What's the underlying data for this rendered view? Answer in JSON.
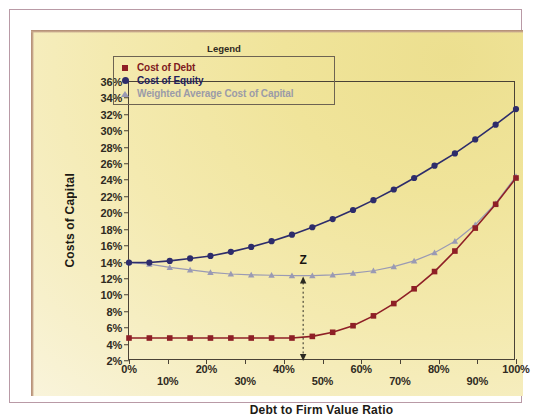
{
  "chart_data": {
    "type": "line",
    "title": "",
    "xlabel": "Debt to Firm Value Ratio",
    "ylabel": "Costs of Capital",
    "xlim": [
      0,
      100
    ],
    "ylim": [
      2,
      36
    ],
    "xticks": [
      "0%",
      "10%",
      "20%",
      "30%",
      "40%",
      "50%",
      "60%",
      "70%",
      "80%",
      "90%",
      "100%"
    ],
    "yticks": [
      "2%",
      "4%",
      "6%",
      "8%",
      "10%",
      "12%",
      "14%",
      "16%",
      "18%",
      "20%",
      "22%",
      "24%",
      "26%",
      "28%",
      "30%",
      "32%",
      "34%",
      "36%"
    ],
    "grid": false,
    "legend_position": "top-center",
    "legend_title": "Legend",
    "x": [
      0,
      5.26,
      10.53,
      15.79,
      21.05,
      26.32,
      31.58,
      36.84,
      42.11,
      47.37,
      52.63,
      57.89,
      63.16,
      68.42,
      73.68,
      78.95,
      84.21,
      89.47,
      94.74,
      100
    ],
    "series": [
      {
        "name": "Cost of Debt",
        "color": "#8e1f26",
        "marker": "square",
        "values": [
          4.8,
          4.8,
          4.8,
          4.8,
          4.8,
          4.8,
          4.8,
          4.8,
          4.8,
          5.0,
          5.5,
          6.3,
          7.5,
          9.0,
          10.8,
          12.9,
          15.4,
          18.2,
          21.1,
          24.3
        ]
      },
      {
        "name": "Cost of Equity",
        "color": "#2d2c6b",
        "marker": "circle",
        "values": [
          14.0,
          14.0,
          14.2,
          14.5,
          14.8,
          15.3,
          15.9,
          16.6,
          17.4,
          18.3,
          19.3,
          20.4,
          21.6,
          22.9,
          24.3,
          25.8,
          27.3,
          29.0,
          30.8,
          32.7
        ]
      },
      {
        "name": "Weighted Average Cost of Capital",
        "color": "#9a9ab4",
        "marker": "triangle",
        "values": [
          14.0,
          13.8,
          13.4,
          13.1,
          12.8,
          12.6,
          12.5,
          12.45,
          12.4,
          12.4,
          12.5,
          12.7,
          13.0,
          13.5,
          14.2,
          15.2,
          16.6,
          18.6,
          21.2,
          24.5
        ]
      }
    ],
    "annotations": [
      {
        "text": "Z",
        "x": 45,
        "y_top": 12.3,
        "y_bottom": 2.0,
        "style": "dashed-double-arrow"
      }
    ]
  },
  "legend": {
    "title": "Legend",
    "items": [
      {
        "label": "Cost of Debt",
        "marker": "square-marker-icon"
      },
      {
        "label": "Cost of Equity",
        "marker": "circle-marker-icon"
      },
      {
        "label": "Weighted Average Cost of Capital",
        "marker": "triangle-marker-icon"
      }
    ]
  },
  "axes": {
    "y_title": "Costs of Capital",
    "x_title": "Debt to Firm Value Ratio"
  },
  "colors": {
    "panel_light": "#f9f4db",
    "panel_dark": "#ecdf8f",
    "frame": "#b99aa6",
    "axis": "#4a4236",
    "cost_of_debt": "#8e1f26",
    "cost_of_equity": "#2d2c6b",
    "wacc": "#9a9ab4"
  }
}
